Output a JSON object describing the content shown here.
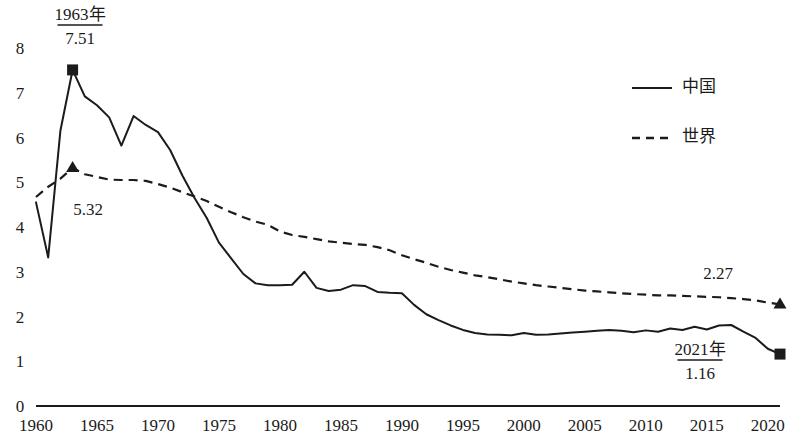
{
  "chart_data": {
    "type": "line",
    "title": "",
    "subtitle": "",
    "xlabel": "",
    "ylabel": "",
    "xlim": [
      1960,
      2021
    ],
    "ylim": [
      0,
      8
    ],
    "grid": false,
    "legend_position": "top-right",
    "x_ticks": [
      "1960",
      "1965",
      "1970",
      "1975",
      "1980",
      "1985",
      "1990",
      "1995",
      "2000",
      "2005",
      "2010",
      "2015",
      "2020"
    ],
    "x_tick_values": [
      1960,
      1965,
      1970,
      1975,
      1980,
      1985,
      1990,
      1995,
      2000,
      2005,
      2010,
      2015,
      2020
    ],
    "y_ticks": [
      "0",
      "1",
      "2",
      "3",
      "4",
      "5",
      "6",
      "7",
      "8"
    ],
    "y_tick_values": [
      0,
      1,
      2,
      3,
      4,
      5,
      6,
      7,
      8
    ],
    "x": [
      1960,
      1961,
      1962,
      1963,
      1964,
      1965,
      1966,
      1967,
      1968,
      1969,
      1970,
      1971,
      1972,
      1973,
      1974,
      1975,
      1976,
      1977,
      1978,
      1979,
      1980,
      1981,
      1982,
      1983,
      1984,
      1985,
      1986,
      1987,
      1988,
      1989,
      1990,
      1991,
      1992,
      1993,
      1994,
      1995,
      1996,
      1997,
      1998,
      1999,
      2000,
      2001,
      2002,
      2003,
      2004,
      2005,
      2006,
      2007,
      2008,
      2009,
      2010,
      2011,
      2012,
      2013,
      2014,
      2015,
      2016,
      2017,
      2018,
      2019,
      2020,
      2021
    ],
    "series": [
      {
        "name": "中国",
        "style": "solid",
        "values": [
          4.55,
          3.32,
          6.15,
          7.51,
          6.92,
          6.72,
          6.45,
          5.82,
          6.48,
          6.28,
          6.12,
          5.72,
          5.15,
          4.65,
          4.2,
          3.65,
          3.3,
          2.95,
          2.74,
          2.7,
          2.7,
          2.71,
          3.0,
          2.64,
          2.57,
          2.6,
          2.7,
          2.68,
          2.55,
          2.53,
          2.52,
          2.26,
          2.05,
          1.92,
          1.8,
          1.7,
          1.63,
          1.6,
          1.59,
          1.58,
          1.63,
          1.59,
          1.6,
          1.62,
          1.64,
          1.66,
          1.68,
          1.7,
          1.68,
          1.65,
          1.69,
          1.66,
          1.73,
          1.7,
          1.77,
          1.71,
          1.8,
          1.81,
          1.66,
          1.52,
          1.28,
          1.16
        ]
      },
      {
        "name": "世界",
        "style": "dashed",
        "values": [
          4.67,
          4.9,
          5.08,
          5.32,
          5.18,
          5.12,
          5.06,
          5.05,
          5.05,
          5.03,
          4.96,
          4.88,
          4.78,
          4.68,
          4.58,
          4.45,
          4.33,
          4.22,
          4.12,
          4.05,
          3.9,
          3.82,
          3.78,
          3.73,
          3.68,
          3.65,
          3.62,
          3.6,
          3.55,
          3.48,
          3.37,
          3.28,
          3.2,
          3.11,
          3.04,
          2.98,
          2.92,
          2.88,
          2.83,
          2.78,
          2.74,
          2.7,
          2.67,
          2.64,
          2.61,
          2.58,
          2.56,
          2.54,
          2.52,
          2.5,
          2.49,
          2.47,
          2.47,
          2.46,
          2.45,
          2.44,
          2.43,
          2.41,
          2.39,
          2.36,
          2.31,
          2.27
        ]
      }
    ],
    "annotations": [
      {
        "id": "china-peak",
        "title": "1963年",
        "value": "7.51",
        "x": 1963,
        "y": 7.51,
        "marker": "square",
        "underline": true,
        "label_x_px": 80,
        "label_y_px": 20
      },
      {
        "id": "world-peak",
        "title": "",
        "value": "5.32",
        "x": 1963,
        "y": 5.32,
        "marker": "triangle",
        "underline": false,
        "label_x_px": 88,
        "label_y_px": 215
      },
      {
        "id": "china-last",
        "title": "2021年",
        "value": "1.16",
        "x": 2021,
        "y": 1.16,
        "marker": "square",
        "underline": true,
        "label_x_px": 700,
        "label_y_px": 355
      },
      {
        "id": "world-last",
        "title": "",
        "value": "2.27",
        "x": 2021,
        "y": 2.27,
        "marker": "triangle",
        "underline": false,
        "label_x_px": 718,
        "label_y_px": 279
      }
    ],
    "legend": [
      {
        "label": "中国",
        "style": "solid"
      },
      {
        "label": "世界",
        "style": "dashed"
      }
    ],
    "colors": {
      "line": "#1b1b1b",
      "axis": "#1b1b1b",
      "text": "#1b1b1b",
      "background": "#ffffff"
    }
  },
  "geometry": {
    "plot_left": 36,
    "plot_right": 780,
    "plot_top": 48,
    "plot_bottom": 406,
    "y_axis_label_x": 20,
    "x_axis_label_y": 431,
    "legend_line_x1": 632,
    "legend_line_x2": 672,
    "legend_text_x": 682,
    "legend_row1_y": 88,
    "legend_row2_y": 138
  }
}
